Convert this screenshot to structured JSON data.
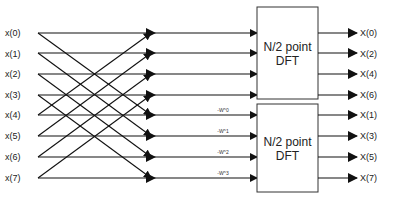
{
  "diagram": {
    "type": "FFT radix-2 decimation-in-frequency butterfly (first stage)",
    "inputs": [
      "x(0)",
      "x(1)",
      "x(2)",
      "x(3)",
      "x(4)",
      "x(5)",
      "x(6)",
      "x(7)"
    ],
    "blocks": [
      {
        "line1": "N/2 point",
        "line2": "DFT",
        "outputs": [
          "X(0)",
          "X(2)",
          "X(4)",
          "X(6)"
        ]
      },
      {
        "line1": "N/2 point",
        "line2": "DFT",
        "outputs": [
          "X(1)",
          "X(3)",
          "X(5)",
          "X(7)"
        ]
      }
    ],
    "twiddle_labels": [
      "-W^0",
      "-W^1",
      "-W^2",
      "-W^3"
    ],
    "colors": {
      "line": "#111111",
      "text": "#222222",
      "box_border": "#333333"
    }
  }
}
